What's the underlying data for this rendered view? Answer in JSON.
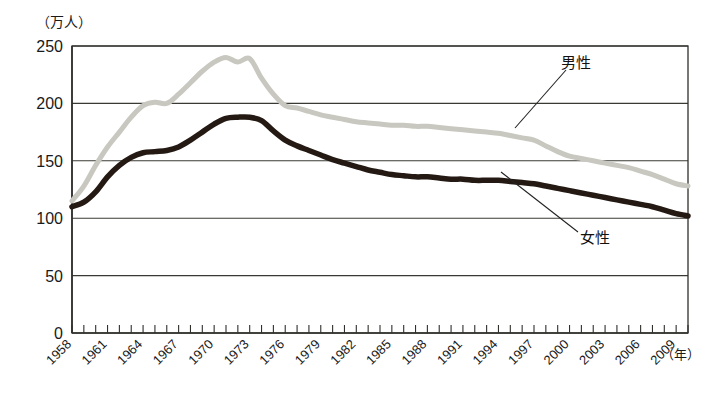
{
  "chart_data": {
    "type": "line",
    "title": "",
    "subtitle": "",
    "xlabel": "年",
    "ylabel": "万人",
    "ylabel_display": "（万人）",
    "xlabel_display": "（年）",
    "xlim": [
      1958,
      2010
    ],
    "ylim": [
      0,
      250
    ],
    "yticks": [
      0,
      50,
      100,
      150,
      200,
      250
    ],
    "ytick_labels": [
      "0",
      "50",
      "100",
      "150",
      "200",
      "250"
    ],
    "xticks": [
      1958,
      1961,
      1964,
      1967,
      1970,
      1973,
      1976,
      1979,
      1982,
      1985,
      1988,
      1991,
      1994,
      1997,
      2000,
      2003,
      2006,
      2009
    ],
    "xtick_labels": [
      "1958",
      "1961",
      "1964",
      "1967",
      "1970",
      "1973",
      "1976",
      "1979",
      "1982",
      "1985",
      "1988",
      "1991",
      "1994",
      "1997",
      "2000",
      "2003",
      "2006",
      "2009"
    ],
    "x_minor_tick_step": 1,
    "grid": "horizontal",
    "legend_position": "inline-annotations",
    "x": [
      1958,
      1959,
      1960,
      1961,
      1962,
      1963,
      1964,
      1965,
      1966,
      1967,
      1968,
      1969,
      1970,
      1971,
      1972,
      1973,
      1974,
      1975,
      1976,
      1977,
      1978,
      1979,
      1980,
      1981,
      1982,
      1983,
      1984,
      1985,
      1986,
      1987,
      1988,
      1989,
      1990,
      1991,
      1992,
      1993,
      1994,
      1995,
      1996,
      1997,
      1998,
      1999,
      2000,
      2001,
      2002,
      2003,
      2004,
      2005,
      2006,
      2007,
      2008,
      2009,
      2010
    ],
    "series": [
      {
        "name": "男性",
        "label": "男性",
        "color": "#c8c8c0",
        "values": [
          115,
          128,
          146,
          162,
          175,
          188,
          198,
          201,
          200,
          208,
          218,
          228,
          236,
          240,
          236,
          239,
          222,
          208,
          198,
          196,
          193,
          190,
          188,
          186,
          184,
          183,
          182,
          181,
          181,
          180,
          180,
          179,
          178,
          177,
          176,
          175,
          174,
          172,
          170,
          168,
          163,
          158,
          154,
          152,
          150,
          148,
          146,
          144,
          141,
          138,
          134,
          130,
          128
        ]
      },
      {
        "name": "女性",
        "label": "女性",
        "color": "#241a13",
        "values": [
          110,
          114,
          123,
          136,
          146,
          153,
          157,
          158,
          159,
          162,
          168,
          175,
          182,
          187,
          188,
          188,
          185,
          176,
          168,
          163,
          159,
          155,
          151,
          148,
          145,
          142,
          140,
          138,
          137,
          136,
          136,
          135,
          134,
          134,
          133,
          133,
          133,
          132,
          131,
          130,
          128,
          126,
          124,
          122,
          120,
          118,
          116,
          114,
          112,
          110,
          107,
          104,
          102
        ]
      }
    ],
    "annotations": [
      {
        "name": "male-annotation",
        "text": "男性",
        "target_year": 1998,
        "target_value": 163
      },
      {
        "name": "female-annotation",
        "text": "女性",
        "target_year": 1990,
        "target_value": 134
      }
    ]
  }
}
